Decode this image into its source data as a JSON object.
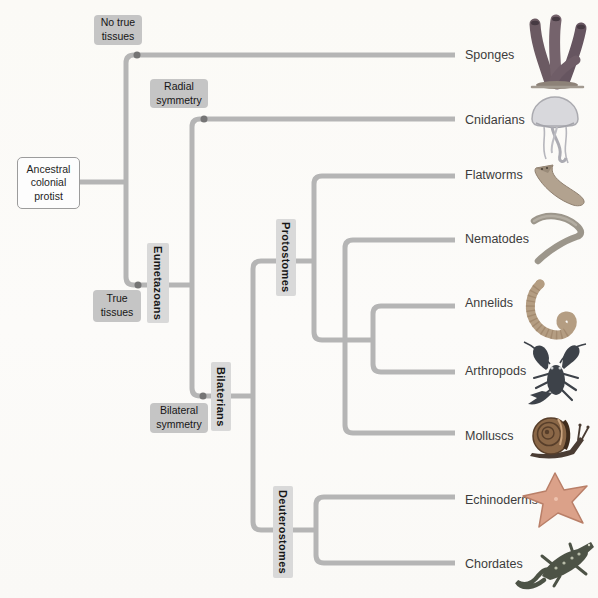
{
  "root_box": {
    "label": "Ancestral\ncolonial\nprotist"
  },
  "trait_labels": {
    "no_true_tissues": "No true\ntissues",
    "radial_symmetry": "Radial\nsymmetry",
    "true_tissues": "True\ntissues",
    "bilateral_symmetry": "Bilateral\nsymmetry"
  },
  "clade_labels": {
    "eumetazoans": "Eumetazoans",
    "bilaterians": "Bilaterians",
    "protostomes": "Protostomes",
    "deuterostomes": "Deuterostomes"
  },
  "taxa": [
    {
      "name": "Sponges",
      "icon": "sponge-illustration"
    },
    {
      "name": "Cnidarians",
      "icon": "jellyfish-illustration"
    },
    {
      "name": "Flatworms",
      "icon": "flatworm-illustration"
    },
    {
      "name": "Nematodes",
      "icon": "nematode-illustration"
    },
    {
      "name": "Annelids",
      "icon": "annelid-worm-illustration"
    },
    {
      "name": "Arthropods",
      "icon": "crayfish-illustration"
    },
    {
      "name": "Molluscs",
      "icon": "snail-illustration"
    },
    {
      "name": "Echinoderms",
      "icon": "sea-star-illustration"
    },
    {
      "name": "Chordates",
      "icon": "lizard-illustration"
    }
  ],
  "colors": {
    "branch": "#b5b5b5",
    "node_dot": "#757575",
    "trait_bg": "#c5c5c5",
    "clade_bg": "#d9d9d9",
    "root_box_bg": "#fdfdfd",
    "root_box_border": "#9c9c9c",
    "text": "#1f1f1f",
    "taxon_text": "#3c3c3c",
    "page_bg": "#fbfaf7"
  }
}
